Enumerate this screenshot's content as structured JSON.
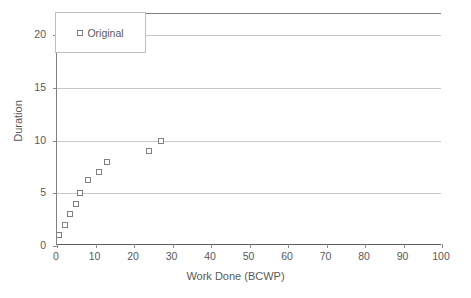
{
  "chart_data": {
    "type": "scatter",
    "title": "",
    "xlabel": "Work Done (BCWP)",
    "ylabel": "Duration",
    "xlim": [
      0,
      100
    ],
    "ylim": [
      0,
      22
    ],
    "xticks": [
      0,
      10,
      20,
      30,
      40,
      50,
      60,
      70,
      80,
      90,
      100
    ],
    "yticks": [
      0,
      5,
      10,
      15,
      20
    ],
    "grid": "horizontal",
    "legend_position": "top-left",
    "series": [
      {
        "name": "Original",
        "marker": "open-square",
        "marker_color": "#808080",
        "points": [
          {
            "x": 0.5,
            "y": 1
          },
          {
            "x": 2,
            "y": 2
          },
          {
            "x": 3.5,
            "y": 3
          },
          {
            "x": 5,
            "y": 4
          },
          {
            "x": 6,
            "y": 5
          },
          {
            "x": 8,
            "y": 6.3
          },
          {
            "x": 11,
            "y": 7
          },
          {
            "x": 13,
            "y": 8
          },
          {
            "x": 24,
            "y": 9
          },
          {
            "x": 27,
            "y": 10
          }
        ]
      }
    ]
  },
  "legend": {
    "entries": [
      {
        "label": "Original",
        "marker_icon": "open-square-marker-icon"
      }
    ]
  },
  "axes": {
    "x_title": "Work Done (BCWP)",
    "y_title": "Duration",
    "x_tick_labels": [
      "0",
      "10",
      "20",
      "30",
      "40",
      "50",
      "60",
      "70",
      "80",
      "90",
      "100"
    ],
    "y_tick_labels": [
      "0",
      "5",
      "10",
      "15",
      "20"
    ]
  },
  "colors": {
    "marker_outline": "#808080",
    "gridline": "#c8c8c8",
    "axis_line": "#595959",
    "text": "#595959",
    "plot_background": "#ffffff",
    "legend_border": "#bfbfbf"
  }
}
